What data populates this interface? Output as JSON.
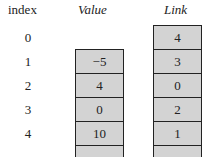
{
  "headers": {
    "index": "index",
    "value": "Value",
    "link": "Link"
  },
  "indices": [
    "0",
    "1",
    "2",
    "3",
    "4"
  ],
  "value_cells": [
    "−5",
    "4",
    "0",
    "10",
    ""
  ],
  "link_cells": [
    "4",
    "3",
    "0",
    "2",
    "1",
    ""
  ]
}
